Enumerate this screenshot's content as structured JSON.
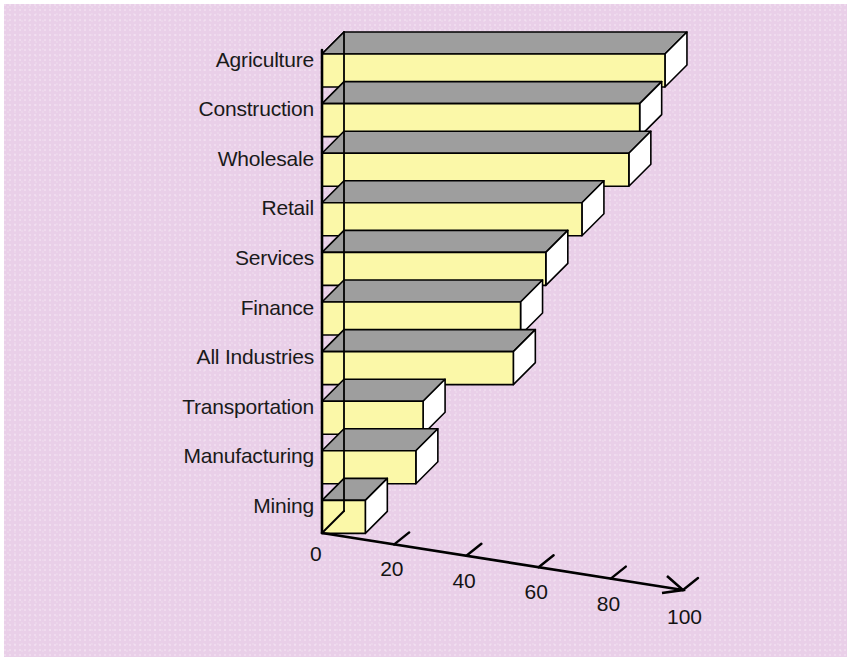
{
  "chart_data": {
    "type": "bar",
    "orientation": "horizontal",
    "style": "3d-perspective",
    "title": "",
    "subtitle": "",
    "xlabel": "",
    "ylabel": "",
    "categories": [
      "Agriculture",
      "Construction",
      "Wholesale",
      "Retail",
      "Services",
      "Finance",
      "All Industries",
      "Transportation",
      "Manufacturing",
      "Mining"
    ],
    "values": [
      95,
      88,
      85,
      72,
      62,
      55,
      53,
      28,
      26,
      12
    ],
    "xlim": [
      0,
      100
    ],
    "xticks": [
      0,
      20,
      40,
      60,
      80,
      100
    ],
    "xtick_labels": [
      "0",
      "20",
      "40",
      "60",
      "80",
      "100"
    ],
    "grid": false,
    "legend": false,
    "legend_position": "none",
    "series": [
      {
        "name": "",
        "values": [
          95,
          88,
          85,
          72,
          62,
          55,
          53,
          28,
          26,
          12
        ]
      }
    ],
    "colors": {
      "background": "#e9cfe8",
      "bar_face": "#fbf8a8",
      "bar_top": "#9e9e9e",
      "bar_end": "#ffffff",
      "outline": "#000000",
      "axis": "#000000",
      "text": "#1a1a1a",
      "frame": "#ffffff"
    }
  },
  "axis": {
    "x_ticks": [
      {
        "label": "0"
      },
      {
        "label": "20"
      },
      {
        "label": "40"
      },
      {
        "label": "60"
      },
      {
        "label": "80"
      },
      {
        "label": "100"
      }
    ]
  },
  "bars": [
    {
      "label": "Agriculture",
      "value": 95
    },
    {
      "label": "Construction",
      "value": 88
    },
    {
      "label": "Wholesale",
      "value": 85
    },
    {
      "label": "Retail",
      "value": 72
    },
    {
      "label": "Services",
      "value": 62
    },
    {
      "label": "Finance",
      "value": 55
    },
    {
      "label": "All Industries",
      "value": 53
    },
    {
      "label": "Transportation",
      "value": 28
    },
    {
      "label": "Manufacturing",
      "value": 26
    },
    {
      "label": "Mining",
      "value": 12
    }
  ]
}
